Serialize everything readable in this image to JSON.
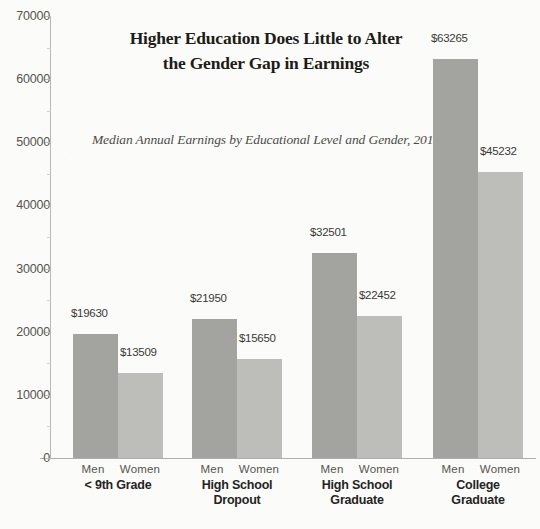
{
  "chart_data": {
    "type": "bar",
    "title": "Higher Education Does Little to Alter the Gender Gap in Earnings",
    "title_line1": "Higher Education Does Little to Alter",
    "title_line2": "the Gender Gap in Earnings",
    "subtitle": "Median Annual Earnings by Educational Level and Gender, 2010",
    "xlabel": "",
    "ylabel": "",
    "ylim": [
      0,
      70000
    ],
    "ytick_step": 10000,
    "yticks": [
      "0",
      "10000",
      "20000",
      "30000",
      "40000",
      "50000",
      "60000",
      "70000"
    ],
    "grid": false,
    "legend_position": "none",
    "categories": [
      "< 9th Grade",
      "High School Dropout",
      "High School Graduate",
      "College Graduate"
    ],
    "category_lines": [
      [
        "< 9th Grade"
      ],
      [
        "High School",
        "Dropout"
      ],
      [
        "High School",
        "Graduate"
      ],
      [
        "College",
        "Graduate"
      ]
    ],
    "series": [
      {
        "name": "Men",
        "color": "#a3a3a0",
        "values": [
          19630,
          21950,
          32501,
          63265
        ],
        "labels": [
          "$19630",
          "$21950",
          "$32501",
          "$63265"
        ]
      },
      {
        "name": "Women",
        "color": "#bdbdba",
        "values": [
          13509,
          15650,
          22452,
          45232
        ],
        "labels": [
          "$13509",
          "$15650",
          "$22452",
          "$45232"
        ]
      }
    ],
    "gender_tick_labels": [
      "Men",
      "Women"
    ]
  }
}
